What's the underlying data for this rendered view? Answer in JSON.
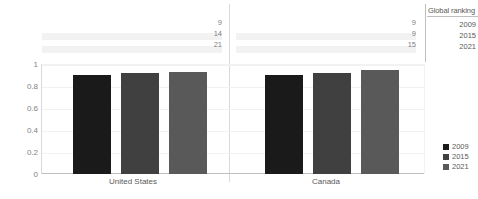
{
  "chart_data": {
    "type": "bar",
    "title": "",
    "subtitle": "",
    "xlabel": "",
    "ylabel": "",
    "categories": [
      "United States",
      "Canada"
    ],
    "series": [
      {
        "name": "2009",
        "color": "#1a1a1a",
        "values": [
          0.9,
          0.9
        ]
      },
      {
        "name": "2015",
        "color": "#404040",
        "values": [
          0.92,
          0.92
        ]
      },
      {
        "name": "2021",
        "color": "#595959",
        "values": [
          0.925,
          0.945
        ]
      }
    ],
    "ylim": [
      0,
      1
    ],
    "yticks": [
      "1",
      "0.8",
      "0.6",
      "0.4",
      "0.2",
      "0"
    ],
    "ytick_values": [
      1,
      0.8,
      0.6,
      0.4,
      0.2,
      0
    ],
    "grid": true,
    "legend_position": "right",
    "annotations": {
      "header": "Global ranking",
      "year_labels": [
        "2009",
        "2015",
        "2021"
      ],
      "groups": [
        {
          "category": "United States",
          "ranks": [
            "9",
            "14",
            "21"
          ]
        },
        {
          "category": "Canada",
          "ranks": [
            "9",
            "9",
            "15"
          ]
        }
      ]
    }
  },
  "legend": {
    "items": [
      {
        "label": "2009",
        "color": "#1a1a1a"
      },
      {
        "label": "2015",
        "color": "#404040"
      },
      {
        "label": "2021",
        "color": "#595959"
      }
    ]
  }
}
